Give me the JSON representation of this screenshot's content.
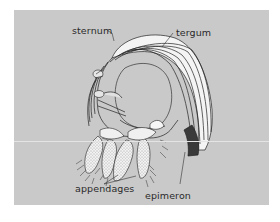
{
  "figure": {
    "background_color": "#c9c9c9",
    "page_color": "#ffffff",
    "labels": {
      "sternum": "sternum",
      "tergum": "tergum",
      "appendages": "appendages",
      "epimeron": "epimeron"
    }
  }
}
